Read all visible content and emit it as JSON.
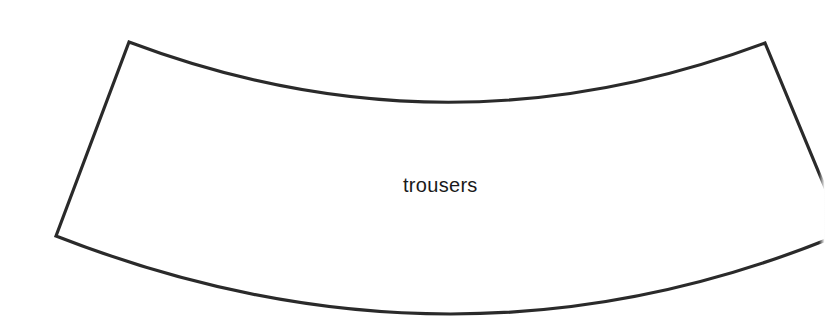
{
  "diagram": {
    "type": "pattern-piece",
    "shape": "annular-sector",
    "label": "trousers",
    "stroke_color": "#2a2a2a",
    "fill_color": "#ffffff",
    "background": "#ffffff"
  }
}
